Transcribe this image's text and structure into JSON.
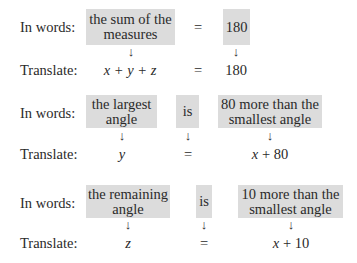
{
  "labels": {
    "words": "In words:",
    "translate": "Translate:"
  },
  "rows": [
    {
      "words": [
        "the sum of the measures",
        "=",
        "180"
      ],
      "translate": {
        "lhs": "x + y + z",
        "eq": "=",
        "rhs": "180"
      }
    },
    {
      "words": [
        "the largest angle",
        "is",
        "80 more than the smallest angle"
      ],
      "translate": {
        "lhs": "y",
        "eq": "=",
        "rhs": "x + 80"
      }
    },
    {
      "words": [
        "the remaining angle",
        "is",
        "10 more than the smallest angle"
      ],
      "translate": {
        "lhs": "z",
        "eq": "=",
        "rhs": "x + 10"
      }
    }
  ],
  "arrow": "↓",
  "colors": {
    "box": "#dcdcdc",
    "text": "#2a2a2a"
  }
}
